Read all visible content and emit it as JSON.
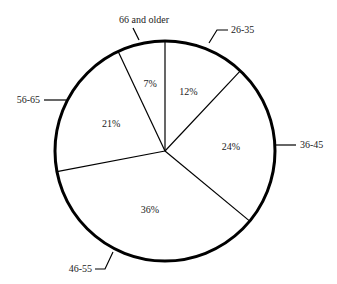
{
  "chart_data": {
    "type": "pie",
    "title": "",
    "categories": [
      "26-35",
      "36-45",
      "46-55",
      "56-65",
      "66 and older"
    ],
    "values": [
      12,
      24,
      36,
      21,
      7
    ],
    "value_labels": [
      "12%",
      "24%",
      "36%",
      "21%",
      "7%"
    ],
    "start_angle_deg": 0,
    "direction": "clockwise",
    "legend": "callout lines outside pie",
    "colors": {
      "fill": "#ffffff",
      "stroke": "#000000"
    }
  }
}
